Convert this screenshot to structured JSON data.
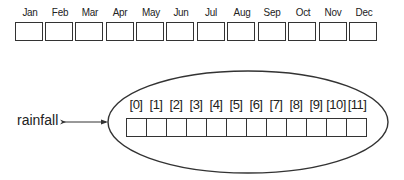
{
  "months": [
    "Jan",
    "Feb",
    "Mar",
    "Apr",
    "May",
    "Jun",
    "Jul",
    "Aug",
    "Sep",
    "Oct",
    "Nov",
    "Dec"
  ],
  "array": {
    "variable_name": "rainfall",
    "indices": [
      "[0]",
      "[1]",
      "[2]",
      "[3]",
      "[4]",
      "[5]",
      "[6]",
      "[7]",
      "[8]",
      "[9]",
      "[10]",
      "[11]"
    ]
  },
  "colors": {
    "stroke": "#333333",
    "background": "#ffffff"
  }
}
